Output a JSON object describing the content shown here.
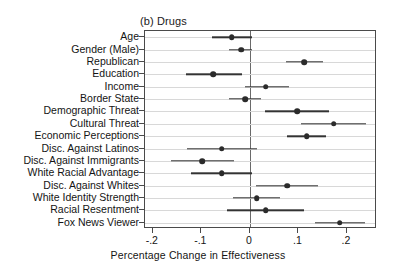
{
  "chart_data": {
    "type": "scatter",
    "subtype": "coefficient-plot-with-error-bars",
    "title": "(b) Drugs",
    "xlabel": "Percentage Change in Effectiveness",
    "ylabel": "",
    "xlim": [
      -0.216,
      0.262
    ],
    "ylim": [
      0,
      16
    ],
    "grid": true,
    "legend": null,
    "zero_reference_line": 0,
    "xticks": [
      -0.2,
      -0.1,
      0,
      0.1,
      0.2
    ],
    "xtick_labels": [
      "-.2",
      "-.1",
      "0",
      ".1",
      ".2"
    ],
    "categories": [
      "Age",
      "Gender (Male)",
      "Republican",
      "Education",
      "Income",
      "Border State",
      "Demographic Threat",
      "Cultural Threat",
      "Economic Perceptions",
      "Disc. Against Latinos",
      "Disc. Against Immigrants",
      "White Racial Advantage",
      "Disc. Against Whites",
      "White Identity Strength",
      "Racial Resentment",
      "Fox News Viewer"
    ],
    "points": [
      {
        "label": "Age",
        "estimate": -0.037,
        "ci_low": -0.078,
        "ci_high": 0.004
      },
      {
        "label": "Gender (Male)",
        "estimate": -0.018,
        "ci_low": -0.042,
        "ci_high": 0.004
      },
      {
        "label": "Republican",
        "estimate": 0.112,
        "ci_low": 0.074,
        "ci_high": 0.15
      },
      {
        "label": "Education",
        "estimate": -0.075,
        "ci_low": -0.131,
        "ci_high": -0.016
      },
      {
        "label": "Income",
        "estimate": 0.033,
        "ci_low": -0.01,
        "ci_high": 0.08
      },
      {
        "label": "Border State",
        "estimate": -0.01,
        "ci_low": -0.042,
        "ci_high": 0.023
      },
      {
        "label": "Demographic Threat",
        "estimate": 0.097,
        "ci_low": 0.031,
        "ci_high": 0.163
      },
      {
        "label": "Cultural Threat",
        "estimate": 0.173,
        "ci_low": 0.106,
        "ci_high": 0.24
      },
      {
        "label": "Economic Perceptions",
        "estimate": 0.117,
        "ci_low": 0.077,
        "ci_high": 0.157
      },
      {
        "label": "Disc. Against Latinos",
        "estimate": -0.058,
        "ci_low": -0.13,
        "ci_high": 0.014
      },
      {
        "label": "Disc. Against Immigrants",
        "estimate": -0.098,
        "ci_low": -0.163,
        "ci_high": -0.032
      },
      {
        "label": "White Racial Advantage",
        "estimate": -0.058,
        "ci_low": -0.121,
        "ci_high": 0.005
      },
      {
        "label": "Disc. Against Whites",
        "estimate": 0.077,
        "ci_low": 0.013,
        "ci_high": 0.14
      },
      {
        "label": "White Identity Strength",
        "estimate": 0.014,
        "ci_low": -0.035,
        "ci_high": 0.062
      },
      {
        "label": "Racial Resentment",
        "estimate": 0.033,
        "ci_low": -0.047,
        "ci_high": 0.111
      },
      {
        "label": "Fox News Viewer",
        "estimate": 0.185,
        "ci_low": 0.134,
        "ci_high": 0.238
      }
    ],
    "colors": {
      "marker": "#2b2b2b",
      "ci": "#333333",
      "grid": "#d8d8d8",
      "frame": "#4a4a4a",
      "zero_line": "#6a6a6a",
      "background": "#ffffff",
      "text": "#141414"
    }
  }
}
